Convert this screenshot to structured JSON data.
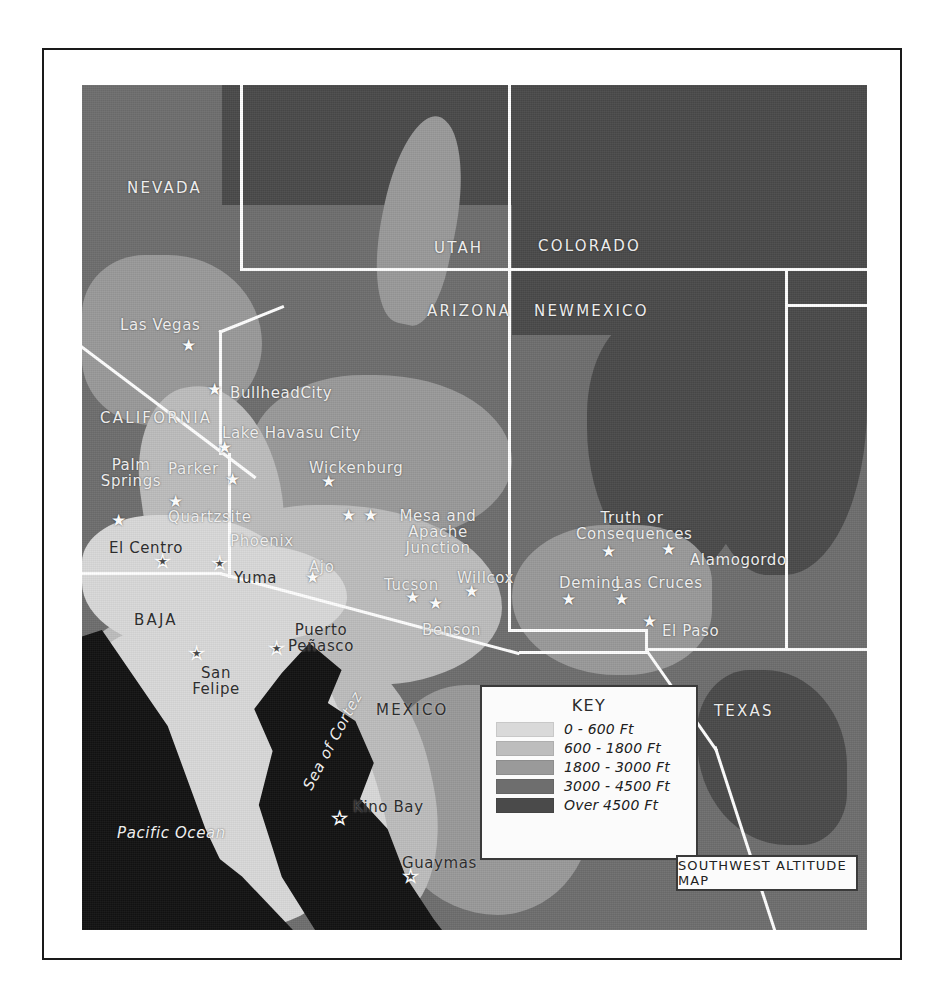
{
  "map": {
    "title": "SOUTHWEST ALTITUDE MAP",
    "key_heading": "KEY",
    "legend": [
      {
        "label": "0 - 600 Ft",
        "color": "#d9d9d9"
      },
      {
        "label": "600 - 1800 Ft",
        "color": "#bdbdbd"
      },
      {
        "label": "1800 - 3000 Ft",
        "color": "#9a9a9a"
      },
      {
        "label": "3000 - 4500 Ft",
        "color": "#6e6e6e"
      },
      {
        "label": "Over 4500 Ft",
        "color": "#4a4a4a"
      }
    ],
    "states": [
      {
        "name": "NEVADA",
        "x": 45,
        "y": 95
      },
      {
        "name": "UTAH",
        "x": 352,
        "y": 155
      },
      {
        "name": "COLORADO",
        "x": 456,
        "y": 153
      },
      {
        "name": "ARIZONA",
        "x": 345,
        "y": 218
      },
      {
        "name": "NEWMEXICO",
        "x": 452,
        "y": 218
      },
      {
        "name": "CALIFORNIA",
        "x": 18,
        "y": 325
      },
      {
        "name": "BAJA",
        "x": 52,
        "y": 527
      },
      {
        "name": "MEXICO",
        "x": 294,
        "y": 617
      },
      {
        "name": "TEXAS",
        "x": 632,
        "y": 618
      }
    ],
    "water_labels": [
      {
        "name": "Sea of Cortez",
        "x": 218,
        "y": 700,
        "rotate": -62
      },
      {
        "name": "Pacific Ocean",
        "x": 35,
        "y": 740
      }
    ],
    "cities": [
      {
        "name": "Las Vegas",
        "lx": 38,
        "ly": 232,
        "sx": 108,
        "sy": 262
      },
      {
        "name": "BullheadCity",
        "lx": 148,
        "ly": 300,
        "sx": 134,
        "sy": 306
      },
      {
        "name": "Lake Havasu City",
        "lx": 140,
        "ly": 340,
        "sx": 144,
        "sy": 364
      },
      {
        "name": "Parker",
        "lx": 86,
        "ly": 376,
        "sx": 152,
        "sy": 396
      },
      {
        "name": "Palm Springs",
        "lx": 10,
        "ly": 372,
        "sx": 38,
        "sy": 437
      },
      {
        "name": "Wickenburg",
        "lx": 227,
        "ly": 375,
        "sx": 248,
        "sy": 398
      },
      {
        "name": "Quartzsite",
        "lx": 86,
        "ly": 424,
        "sx": 95,
        "sy": 418
      },
      {
        "name": "Phoenix",
        "lx": 148,
        "ly": 448,
        "sx": 268,
        "sy": 432
      },
      {
        "name": "Mesa and Apache Junction",
        "lx": 300,
        "ly": 423,
        "sx": 290,
        "sy": 432
      },
      {
        "name": "El Centro",
        "lx": 27,
        "ly": 455,
        "sx": 82,
        "sy": 478,
        "hollow": true
      },
      {
        "name": "Yuma",
        "lx": 152,
        "ly": 485,
        "sx": 139,
        "sy": 480,
        "hollow": true
      },
      {
        "name": "Ajo",
        "lx": 227,
        "ly": 474,
        "sx": 232,
        "sy": 494
      },
      {
        "name": "Tucson",
        "lx": 302,
        "ly": 492,
        "sx": 332,
        "sy": 514
      },
      {
        "name": "Willcox",
        "lx": 375,
        "ly": 485,
        "sx": 391,
        "sy": 508
      },
      {
        "name": "Benson",
        "lx": 340,
        "ly": 537,
        "sx": 355,
        "sy": 520
      },
      {
        "name": "Truth or Consequences",
        "lx": 494,
        "ly": 425,
        "sx": 528,
        "sy": 468
      },
      {
        "name": "Alamogordo",
        "lx": 608,
        "ly": 467,
        "sx": 588,
        "sy": 466
      },
      {
        "name": "Deming",
        "lx": 477,
        "ly": 490,
        "sx": 488,
        "sy": 516
      },
      {
        "name": "Las Cruces",
        "lx": 533,
        "ly": 490,
        "sx": 541,
        "sy": 516
      },
      {
        "name": "El Paso",
        "lx": 580,
        "ly": 538,
        "sx": 569,
        "sy": 538
      },
      {
        "name": "Puerto Peñasco",
        "lx": 200,
        "ly": 537,
        "sx": 196,
        "sy": 565,
        "hollow": true
      },
      {
        "name": "San Felipe",
        "lx": 95,
        "ly": 580,
        "sx": 116,
        "sy": 570,
        "hollow": true
      },
      {
        "name": "Kino Bay",
        "lx": 271,
        "ly": 714,
        "sx": 259,
        "sy": 735,
        "hollow": true
      },
      {
        "name": "Guaymas",
        "lx": 320,
        "ly": 770,
        "sx": 330,
        "sy": 793,
        "hollow": true
      }
    ]
  }
}
